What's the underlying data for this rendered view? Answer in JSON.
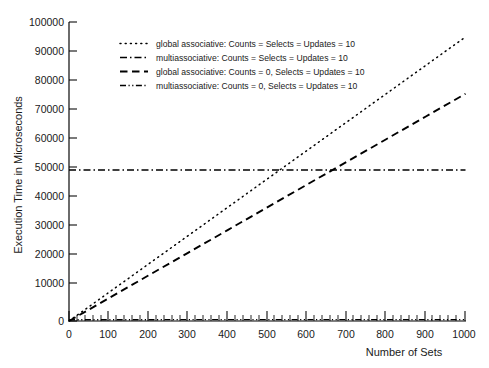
{
  "chart_data": {
    "type": "line",
    "title": "",
    "xlabel": "Number of Sets",
    "ylabel": "Execution Time in Microseconds",
    "xlim": [
      0,
      1000
    ],
    "ylim": [
      0,
      100000
    ],
    "xticks": [
      0,
      100,
      200,
      300,
      400,
      500,
      600,
      700,
      800,
      900,
      1000
    ],
    "yticks": [
      0,
      10000,
      20000,
      30000,
      40000,
      50000,
      60000,
      70000,
      80000,
      90000,
      100000
    ],
    "xtick_labels": [
      "0",
      "100",
      "200",
      "300",
      "400",
      "500",
      "600",
      "700",
      "800",
      "900",
      "1000"
    ],
    "ytick_labels": [
      "0",
      "10000",
      "20000",
      "30000",
      "40000",
      "50000",
      "60000",
      "70000",
      "80000",
      "90000",
      "100000"
    ],
    "grid": false,
    "legend_position": "upper-left-inside",
    "series": [
      {
        "name": "global associative:  Counts = Selects = Updates = 10",
        "style": "dotted",
        "x": [
          0,
          100,
          200,
          300,
          400,
          500,
          600,
          700,
          800,
          900,
          1000
        ],
        "values": [
          0,
          9500,
          19000,
          28500,
          38000,
          47500,
          57000,
          66500,
          76000,
          85500,
          95000
        ]
      },
      {
        "name": "multiassociative:  Counts = Selects = Updates = 10",
        "style": "dash-dot",
        "x": [
          0,
          100,
          200,
          300,
          400,
          500,
          600,
          700,
          800,
          900,
          1000
        ],
        "values": [
          50500,
          50500,
          50500,
          50500,
          50500,
          50500,
          50500,
          50500,
          50500,
          50500,
          50500
        ]
      },
      {
        "name": "global associative:  Counts = 0, Selects = Updates = 10",
        "style": "dashed",
        "x": [
          0,
          100,
          200,
          300,
          400,
          500,
          600,
          700,
          800,
          900,
          1000
        ],
        "values": [
          0,
          7600,
          15200,
          22800,
          30400,
          38000,
          45600,
          53200,
          60800,
          68400,
          76000
        ]
      },
      {
        "name": "multiassociative:  Counts = 0, Selects = Updates = 10",
        "style": "dash-dot-dot",
        "x": [
          0,
          100,
          200,
          300,
          400,
          500,
          600,
          700,
          800,
          900,
          1000
        ],
        "values": [
          400,
          420,
          430,
          440,
          450,
          450,
          460,
          460,
          470,
          470,
          480
        ]
      }
    ]
  },
  "axes": {
    "y_title": "Execution Time in Microseconds",
    "x_title": "Number of Sets"
  },
  "legend": {
    "entries": [
      {
        "style": "dotted",
        "label": "global associative:  Counts = Selects = Updates = 10"
      },
      {
        "style": "dash-dot",
        "label": "multiassociative:  Counts = Selects = Updates = 10"
      },
      {
        "style": "dashed",
        "label": "global associative:  Counts = 0, Selects = Updates = 10"
      },
      {
        "style": "dash-dot-dot",
        "label": "multiassociative:  Counts = 0, Selects = Updates = 10"
      }
    ]
  },
  "ticks": {
    "y": [
      "100000",
      "90000",
      "80000",
      "70000",
      "60000",
      "50000",
      "40000",
      "30000",
      "20000",
      "10000",
      "0"
    ],
    "x": [
      "0",
      "100",
      "200",
      "300",
      "400",
      "500",
      "600",
      "700",
      "800",
      "900",
      "1000"
    ]
  }
}
